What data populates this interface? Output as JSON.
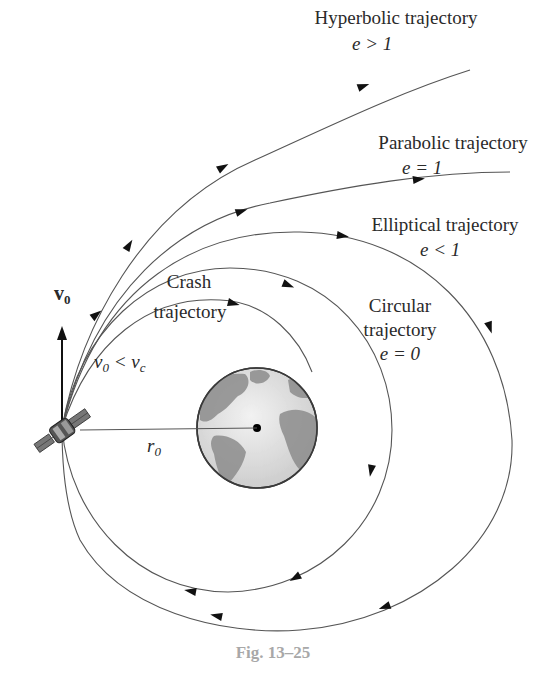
{
  "figure": {
    "caption": "Fig. 13–25",
    "colors": {
      "line": "#555555",
      "arrow": "#111111",
      "caption": "#a8a8a8",
      "earth_ocean": "#e6e6e6",
      "earth_land": "#8c8c8c"
    }
  },
  "labels": {
    "hyperbolic": {
      "title": "Hyperbolic trajectory",
      "condition": "e > 1"
    },
    "parabolic": {
      "title": "Parabolic trajectory",
      "condition": "e = 1"
    },
    "elliptical": {
      "title": "Elliptical trajectory",
      "condition": "e < 1"
    },
    "circular": {
      "line1": "Circular",
      "line2": "trajectory",
      "condition": "e = 0"
    },
    "crash": {
      "line1": "Crash",
      "line2": "trajectory"
    },
    "velocity_vector": {
      "symbol": "v",
      "subscript": "0"
    },
    "velocity_condition": {
      "lhs": "v",
      "lhs_sub": "0",
      "op": " < ",
      "rhs": "v",
      "rhs_sub": "c"
    },
    "radius": {
      "symbol": "r",
      "subscript": "0"
    }
  },
  "elements": {
    "satellite": "satellite-icon",
    "earth": "earth-globe",
    "arrows": "direction-arrow-icon"
  }
}
